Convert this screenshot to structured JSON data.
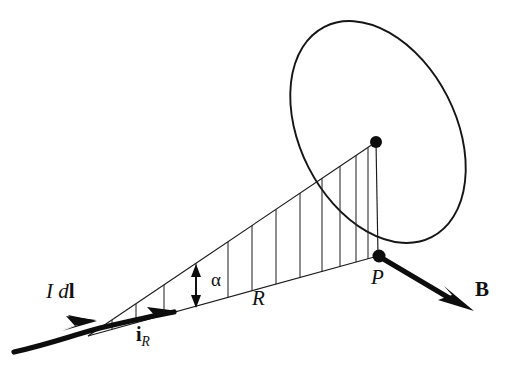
{
  "figure": {
    "background_color": "#ffffff",
    "ink_color": "#111111",
    "width": 518,
    "height": 377
  },
  "labels": {
    "current_element": {
      "text_italic": "I",
      "text_space": " ",
      "text_d": "d",
      "text_l_bold": "l",
      "name": "I dl",
      "x": 46,
      "y": 298,
      "font_size": 21
    },
    "unit_vector": {
      "base": "i",
      "subscript": "R",
      "name": "i_R",
      "x": 136,
      "y": 341,
      "font_size": 20
    },
    "distance": {
      "text": "R",
      "name": "R",
      "x": 252,
      "y": 305,
      "font_size": 21
    },
    "angle": {
      "text": "α",
      "name": "alpha",
      "x": 211,
      "y": 286,
      "font_size": 19
    },
    "field_point": {
      "text": "P",
      "name": "P",
      "x": 371,
      "y": 284,
      "font_size": 21
    },
    "magnetic_field": {
      "text": "B",
      "name": "B",
      "x": 475,
      "y": 296,
      "font_size": 21
    }
  },
  "geometry": {
    "wire": {
      "start_x": 14,
      "start_y": 352,
      "end_x": 172,
      "end_y": 314,
      "description": "thick current-carrying wire from lower left"
    },
    "dl_arrow": {
      "tip_x": 92,
      "tip_y": 323,
      "description": "first arrowhead on wire marking I dl"
    },
    "ir_arrow": {
      "tip_x": 172,
      "tip_y": 312,
      "description": "second arrowhead on wire marking unit vector i_R"
    },
    "wedge": {
      "apex_x": 88,
      "apex_y": 336,
      "bottom_end_x": 378,
      "bottom_end_y": 256,
      "top_end_x": 376,
      "top_end_y": 142,
      "description": "triangular cone cross-section hatched with vertical lines"
    },
    "hatch_count": 12,
    "cone_apex_dot": {
      "x": 376,
      "y": 142,
      "r": 6
    },
    "field_point_dot": {
      "x": 378,
      "y": 256,
      "r": 6
    },
    "alpha_arrow": {
      "x": 196,
      "y_top": 268,
      "y_bottom": 302,
      "description": "double headed vertical arrow measuring cone angle alpha"
    },
    "b_arrow": {
      "start_x": 381,
      "start_y": 258,
      "end_x": 470,
      "end_y": 310,
      "description": "thick arrow for magnetic field B at P"
    },
    "ellipse": {
      "cx": 378,
      "cy": 132,
      "rx": 78,
      "ry": 118,
      "rotation_deg": -27,
      "description": "tilted circle (plane perpendicular to R) drawn as ellipse"
    }
  }
}
